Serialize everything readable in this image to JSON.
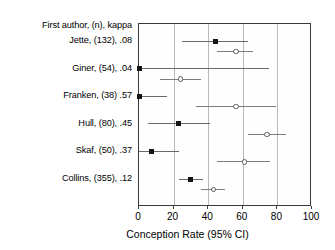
{
  "chart_data": {
    "type": "scatter",
    "title": "",
    "xlabel": "Conception Rate (95% CI)",
    "ylabel": "",
    "xlim": [
      0,
      100
    ],
    "xticks": [
      0,
      20,
      40,
      60,
      80,
      100
    ],
    "xticklabels": [
      "0",
      "20",
      "40",
      "60",
      "80",
      "100"
    ],
    "grid": "vertical",
    "gridlines": [
      20,
      40,
      60,
      80
    ],
    "legend": "none",
    "row_header": "First author, (n), kappa",
    "series": [
      {
        "name": "filled-square",
        "marker": "filled square"
      },
      {
        "name": "open-circle",
        "marker": "open circle"
      }
    ],
    "rows": [
      {
        "label": "Jette, (132), .08",
        "author": "Jette",
        "n": 132,
        "kappa": ".08",
        "estimates": [
          {
            "marker": "square",
            "value": 44,
            "ci_low": 25,
            "ci_high": 63
          },
          {
            "marker": "circle",
            "value": 56,
            "ci_low": 45,
            "ci_high": 66
          }
        ]
      },
      {
        "label": "Giner, (54), .04",
        "author": "Giner",
        "n": 54,
        "kappa": ".04",
        "estimates": [
          {
            "marker": "square",
            "value": 0,
            "ci_low": 0,
            "ci_high": 75
          },
          {
            "marker": "circle",
            "value": 24,
            "ci_low": 12,
            "ci_high": 36
          }
        ]
      },
      {
        "label": "Franken, (38) .57",
        "author": "Franken",
        "n": 38,
        "kappa": ".57",
        "estimates": [
          {
            "marker": "square",
            "value": 0,
            "ci_low": 0,
            "ci_high": 16
          },
          {
            "marker": "circle",
            "value": 56,
            "ci_low": 33,
            "ci_high": 79
          }
        ]
      },
      {
        "label": "Hull,  (80), .45",
        "author": "Hull",
        "n": 80,
        "kappa": ".45",
        "estimates": [
          {
            "marker": "square",
            "value": 23,
            "ci_low": 5,
            "ci_high": 41
          },
          {
            "marker": "circle",
            "value": 74,
            "ci_low": 63,
            "ci_high": 85
          }
        ]
      },
      {
        "label": "Skaf,  (50), .37",
        "author": "Skaf",
        "n": 50,
        "kappa": ".37",
        "estimates": [
          {
            "marker": "square",
            "value": 7,
            "ci_low": 0,
            "ci_high": 23
          },
          {
            "marker": "circle",
            "value": 61,
            "ci_low": 45,
            "ci_high": 76
          }
        ]
      },
      {
        "label": "Collins, (355), .12",
        "author": "Collins",
        "n": 355,
        "kappa": ".12",
        "estimates": [
          {
            "marker": "square",
            "value": 30,
            "ci_low": 23,
            "ci_high": 37
          },
          {
            "marker": "circle",
            "value": 43,
            "ci_low": 36,
            "ci_high": 50
          }
        ]
      }
    ]
  },
  "colors": {
    "frame": "#3a3a3a",
    "grid": "#b9b9b9",
    "square": "#151515",
    "circle_stroke": "#5c5c5c",
    "ci_line": "#7d7d7d",
    "background": "#ffffff"
  }
}
